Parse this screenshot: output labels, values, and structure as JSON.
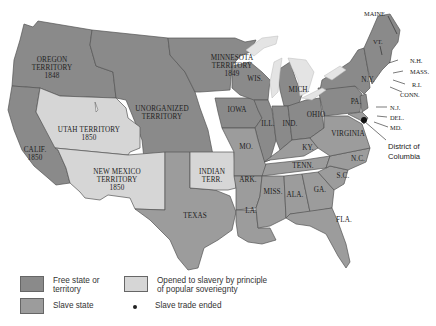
{
  "map": {
    "subject": "The Compromise of 1850",
    "colors": {
      "free": "#8a8a8a",
      "slave": "#9c9c9c",
      "popular_sovereignty": "#d6d6d6",
      "lakes": "#e4e4e4",
      "background": "#ffffff"
    },
    "regions": {
      "oregon": {
        "line1": "OREGON",
        "line2": "TERRITORY",
        "year": "1848",
        "status": "free"
      },
      "minnesota": {
        "line1": "MINNESOTA",
        "line2": "TERRITORY",
        "year": "1849",
        "status": "free"
      },
      "unorganized": {
        "line1": "UNORGANIZED",
        "line2": "TERRITORY",
        "status": "free"
      },
      "utah": {
        "line1": "UTAH TERRITORY",
        "year": "1850",
        "status": "popular_sovereignty"
      },
      "new_mexico": {
        "line1": "NEW MEXICO",
        "line2": "TERRITORY",
        "year": "1850",
        "status": "popular_sovereignty"
      },
      "california": {
        "line1": "CALIF.",
        "year": "1850",
        "status": "free"
      },
      "indian": {
        "line1": "INDIAN",
        "line2": "TERR.",
        "status": "popular_sovereignty"
      },
      "texas": {
        "line1": "TEXAS",
        "status": "slave"
      },
      "iowa": {
        "label": "IOWA",
        "status": "free"
      },
      "wis": {
        "label": "WIS.",
        "status": "free"
      },
      "mich": {
        "label": "MICH.",
        "status": "free"
      },
      "ill": {
        "label": "ILL.",
        "status": "free"
      },
      "ind": {
        "label": "IND.",
        "status": "free"
      },
      "ohio": {
        "label": "OHIO",
        "status": "free"
      },
      "pa": {
        "label": "PA.",
        "status": "free"
      },
      "ny": {
        "label": "N.Y.",
        "status": "free"
      },
      "mo": {
        "label": "MO.",
        "status": "slave"
      },
      "ark": {
        "label": "ARK.",
        "status": "slave"
      },
      "la": {
        "label": "LA.",
        "status": "slave"
      },
      "ky": {
        "label": "KY.",
        "status": "slave"
      },
      "tenn": {
        "label": "TENN.",
        "status": "slave"
      },
      "miss": {
        "label": "MISS.",
        "status": "slave"
      },
      "ala": {
        "label": "ALA.",
        "status": "slave"
      },
      "ga": {
        "label": "GA.",
        "status": "slave"
      },
      "fla": {
        "label": "FLA.",
        "status": "slave"
      },
      "sc": {
        "label": "S.C.",
        "status": "slave"
      },
      "nc": {
        "label": "N.C.",
        "status": "slave"
      },
      "virginia": {
        "label": "VIRGINIA",
        "status": "slave"
      }
    },
    "callouts": {
      "maine": "MAINE",
      "vt": "VT.",
      "nh": "N.H.",
      "mass": "MASS.",
      "ri": "R.I.",
      "conn": "CONN.",
      "nj": "N.J.",
      "del": "DEL.",
      "md": "MD.",
      "dc_line1": "District of",
      "dc_line2": "Columbia"
    }
  },
  "legend": {
    "free": "Free state or territory",
    "free_line1": "Free state or",
    "free_line2": "territory",
    "slave": "Slave state",
    "pop_line1": "Opened to slavery by principle",
    "pop_line2": "of popular soveriegnty",
    "dot": "Slave trade ended"
  }
}
